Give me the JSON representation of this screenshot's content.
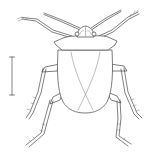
{
  "figure": {
    "subject": "Dorsal view of a shield bug (Hemiptera: Pentatomoidea) line drawing",
    "background_color": "#ffffff",
    "line_color": "#4a4a4a",
    "scale_bar": {
      "orientation": "vertical",
      "x": 12,
      "y_top": 57,
      "y_bottom": 95,
      "label": ""
    },
    "parts": [
      "head",
      "eyes",
      "antennae",
      "pronotum",
      "scutellum",
      "hemelytra",
      "fore-legs",
      "mid-legs",
      "hind-legs"
    ]
  }
}
